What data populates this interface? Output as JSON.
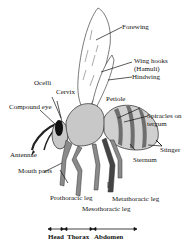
{
  "diagram": {
    "labels": {
      "forewing": "Forewing",
      "wing_hooks_line1": "Wing hooks",
      "wing_hooks_line2": "(Hamuli)",
      "hindwing": "Hindwing",
      "ocelli": "Ocelli",
      "cervix": "Cervix",
      "compound_eye": "Compound eye",
      "petiole": "Petiole",
      "spiracles_line1": "Spiracles on",
      "spiracles_line2": "tergum",
      "antennae": "Antennae",
      "stinger": "Stinger",
      "mouth_parts": "Mouth parts",
      "sternum": "Sternum",
      "prothoracic_leg": "Prothoracic leg",
      "metathoracic_leg": "Metathoracic leg",
      "mesothoracic_leg": "Mesothoracic leg"
    },
    "body_regions": {
      "head": "Head",
      "thorax": "Thorax",
      "abdomen": "Abdomen"
    },
    "colors": {
      "outline": "#222222",
      "body_fill": "#c8c8c8",
      "leg_fill": "#8a8a8a",
      "eye_fill": "#111111",
      "stripe_fill": "#6e6e6e"
    }
  }
}
